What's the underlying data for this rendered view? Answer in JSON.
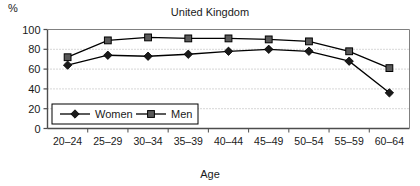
{
  "chart_data": {
    "type": "line",
    "title": "United Kingdom",
    "xlabel": "Age",
    "ylabel": "%",
    "categories": [
      "20–24",
      "25–29",
      "30–34",
      "35–39",
      "40–44",
      "45–49",
      "50–54",
      "55–59",
      "60–64"
    ],
    "series": [
      {
        "name": "Women",
        "marker": "diamond",
        "color": "#000000",
        "values": [
          64,
          74,
          73,
          75,
          78,
          80,
          78,
          68,
          36
        ]
      },
      {
        "name": "Men",
        "marker": "square",
        "color": "#000000",
        "values": [
          72,
          89,
          92,
          91,
          91,
          90,
          88,
          78,
          61
        ]
      }
    ],
    "ylim": [
      0,
      100
    ],
    "yticks": [
      0,
      20,
      40,
      60,
      80,
      100
    ],
    "ytick_labels": [
      "0",
      "20",
      "40",
      "60",
      "80",
      "100"
    ],
    "grid": "horizontal-dotted",
    "legend_position": "inside-lower-left",
    "background": "#ffffff",
    "axis_color": "#4d4d4d",
    "grid_color": "#999999"
  },
  "axis": {
    "y_unit_label": "%",
    "x_title": "Age"
  },
  "legend": {
    "women_label": "Women",
    "men_label": "Men"
  }
}
